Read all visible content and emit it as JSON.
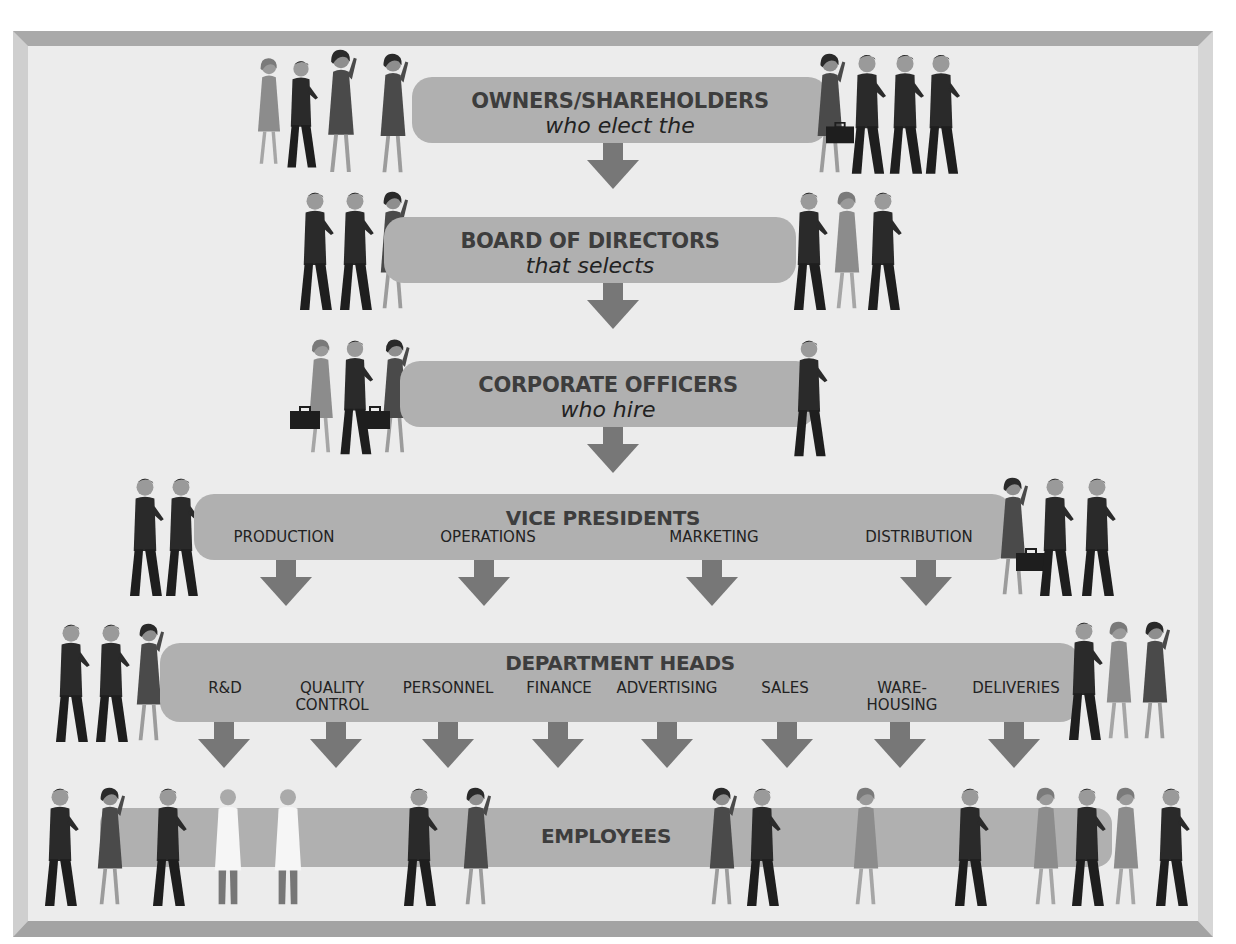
{
  "diagram": {
    "type": "corporate-hierarchy",
    "colors": {
      "bar": "#b0b0b0",
      "arrow": "#777777",
      "text": "#3d3d3d",
      "background": "#ececec",
      "frame": "#a9a9a9"
    },
    "tiers": [
      {
        "id": "owners",
        "title": "OWNERS/SHAREHOLDERS",
        "subtitle": "who elect the"
      },
      {
        "id": "board",
        "title": "BOARD OF DIRECTORS",
        "subtitle": "that selects"
      },
      {
        "id": "officers",
        "title": "CORPORATE OFFICERS",
        "subtitle": "who hire"
      },
      {
        "id": "vps",
        "title": "VICE PRESIDENTS",
        "units": [
          "PRODUCTION",
          "OPERATIONS",
          "MARKETING",
          "DISTRIBUTION"
        ]
      },
      {
        "id": "dept",
        "title": "DEPARTMENT HEADS",
        "units": [
          "R&D",
          "QUALITY CONTROL",
          "PERSONNEL",
          "FINANCE",
          "ADVERTISING",
          "SALES",
          "WARE- HOUSING",
          "DELIVERIES"
        ],
        "units_display": [
          {
            "l1": "R&D",
            "l2": ""
          },
          {
            "l1": "QUALITY",
            "l2": "CONTROL"
          },
          {
            "l1": "PERSONNEL",
            "l2": ""
          },
          {
            "l1": "FINANCE",
            "l2": ""
          },
          {
            "l1": "ADVERTISING",
            "l2": ""
          },
          {
            "l1": "SALES",
            "l2": ""
          },
          {
            "l1": "WARE-",
            "l2": "HOUSING"
          },
          {
            "l1": "DELIVERIES",
            "l2": ""
          }
        ]
      },
      {
        "id": "employees",
        "title": "EMPLOYEES"
      }
    ]
  }
}
